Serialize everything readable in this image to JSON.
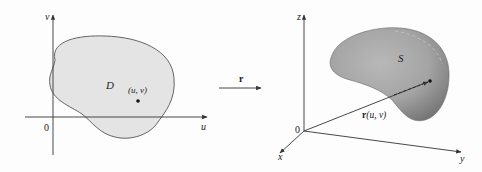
{
  "figure": {
    "left_panel": {
      "axes": {
        "vertical_label": "v",
        "horizontal_label": "u",
        "origin_label": "0"
      },
      "region_label": "D",
      "point_label": "(u, v)",
      "region_fill": "#e4e4e4",
      "region_stroke": "#555555"
    },
    "mapping": {
      "label": "r"
    },
    "right_panel": {
      "axes": {
        "z_label": "z",
        "x_label": "x",
        "y_label": "y",
        "origin_label": "0"
      },
      "surface_label": "S",
      "vector_label": "r(u, v)",
      "vector_label_bold": "r",
      "vector_label_args": "(u, v)",
      "surface_fill_light": "#b5b5b5",
      "surface_fill_dark": "#7d7d7d"
    }
  }
}
